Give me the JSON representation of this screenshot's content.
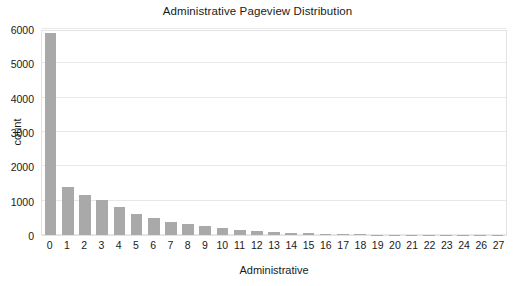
{
  "chart_data": {
    "type": "bar",
    "title": "Administrative Pageview Distribution",
    "xlabel": "Administrative",
    "ylabel": "count",
    "categories": [
      "0",
      "1",
      "2",
      "3",
      "4",
      "5",
      "6",
      "7",
      "8",
      "9",
      "10",
      "11",
      "12",
      "13",
      "14",
      "15",
      "16",
      "17",
      "18",
      "19",
      "20",
      "21",
      "22",
      "23",
      "24",
      "26",
      "27"
    ],
    "values": [
      5870,
      1400,
      1180,
      1010,
      830,
      600,
      500,
      390,
      330,
      260,
      190,
      140,
      110,
      80,
      60,
      45,
      30,
      22,
      16,
      12,
      9,
      7,
      6,
      5,
      4,
      3,
      2
    ],
    "ylim": [
      0,
      6000
    ],
    "yticks": [
      "0",
      "1000",
      "2000",
      "3000",
      "4000",
      "5000",
      "6000"
    ],
    "ytick_values": [
      0,
      1000,
      2000,
      3000,
      4000,
      5000,
      6000
    ],
    "grid": true,
    "legend": false,
    "bar_color": "#a9a9a9",
    "grid_color": "#e8e8e8",
    "background_color": "#ffffff"
  }
}
